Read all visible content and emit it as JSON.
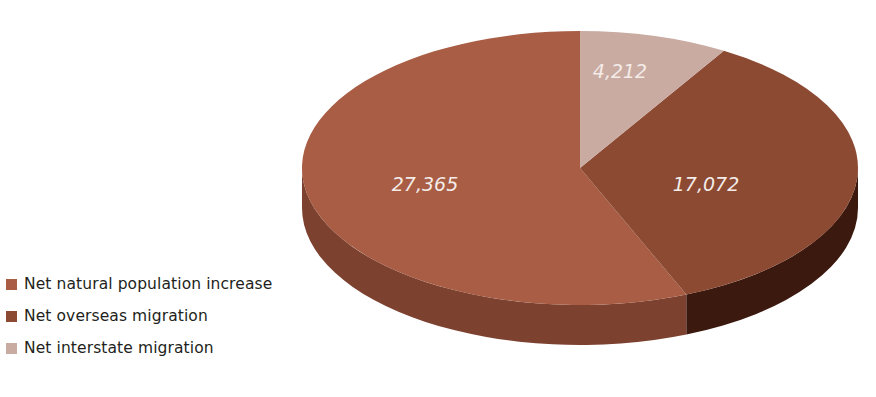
{
  "chart_data": {
    "type": "pie",
    "title": "",
    "three_d": true,
    "categories": [
      "Net natural population increase",
      "Net overseas migration",
      "Net interstate migration"
    ],
    "values": [
      27365,
      17072,
      4212
    ],
    "labels": [
      "27,365",
      "17,072",
      "4,212"
    ],
    "total": 48649,
    "percentages": [
      56.25,
      35.09,
      8.66
    ],
    "colors": [
      "#a85d44",
      "#8c4a33",
      "#c9aba2"
    ],
    "side_colors": [
      "#7d4130",
      "#3b190f",
      "#8e6f66"
    ],
    "start_angle_deg": 0,
    "direction": "clockwise",
    "legend_position": "left",
    "grid": false,
    "xlabel": "",
    "ylabel": ""
  },
  "legend": {
    "items": [
      {
        "label": "Net natural population increase",
        "color": "#a85d44"
      },
      {
        "label": "Net overseas migration",
        "color": "#8c4a33"
      },
      {
        "label": "Net interstate migration",
        "color": "#c9aba2"
      }
    ]
  },
  "pie_labels": {
    "natural": "27,365",
    "overseas": "17,072",
    "interstate": "4,212"
  }
}
